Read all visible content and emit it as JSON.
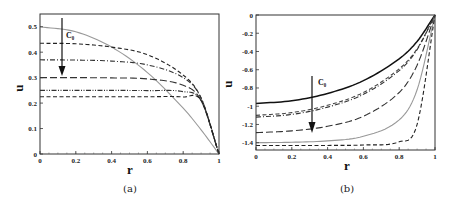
{
  "chart_data": [
    {
      "type": "line",
      "panel": "a",
      "caption": "(a)",
      "xlabel": "r",
      "ylabel": "u",
      "xlim": [
        0,
        1
      ],
      "ylim": [
        0,
        0.55
      ],
      "xticks": [
        "0",
        "0.2",
        "0.4",
        "0.6",
        "0.8",
        "1"
      ],
      "yticks": [
        "0",
        "0.1",
        "0.2",
        "0.3",
        "0.4",
        "0.5"
      ],
      "annotation": "C₀",
      "annotation_arrow": "down, increasing C₀",
      "grid": false,
      "series": [
        {
          "name": "curve-1",
          "style": "solid-gray",
          "color": "#999999",
          "u_at_r0": 0.5,
          "shape": "parabolic",
          "x": [
            0,
            0.2,
            0.4,
            0.6,
            0.8,
            0.9,
            1.0
          ],
          "values": [
            0.5,
            0.48,
            0.42,
            0.32,
            0.18,
            0.095,
            0.0
          ]
        },
        {
          "name": "curve-2",
          "style": "dashed",
          "color": "#222222",
          "u_at_r0": 0.435,
          "x": [
            0,
            0.2,
            0.4,
            0.6,
            0.8,
            0.9,
            1.0
          ],
          "values": [
            0.435,
            0.433,
            0.42,
            0.39,
            0.31,
            0.22,
            0.0
          ]
        },
        {
          "name": "curve-3",
          "style": "dash-dot",
          "color": "#333333",
          "u_at_r0": 0.37,
          "x": [
            0,
            0.2,
            0.4,
            0.6,
            0.8,
            0.9,
            1.0
          ],
          "values": [
            0.37,
            0.369,
            0.365,
            0.35,
            0.3,
            0.22,
            0.0
          ]
        },
        {
          "name": "curve-4",
          "style": "long-dash",
          "color": "#333333",
          "u_at_r0": 0.3,
          "x": [
            0,
            0.2,
            0.4,
            0.6,
            0.8,
            0.9,
            1.0
          ],
          "values": [
            0.3,
            0.3,
            0.299,
            0.295,
            0.27,
            0.21,
            0.0
          ]
        },
        {
          "name": "curve-5",
          "style": "dash-dot-dot",
          "color": "#333333",
          "u_at_r0": 0.25,
          "x": [
            0,
            0.2,
            0.4,
            0.6,
            0.8,
            0.9,
            1.0
          ],
          "values": [
            0.25,
            0.25,
            0.25,
            0.249,
            0.245,
            0.21,
            0.0
          ]
        },
        {
          "name": "curve-6",
          "style": "dashed",
          "color": "#222222",
          "u_at_r0": 0.225,
          "x": [
            0,
            0.2,
            0.4,
            0.6,
            0.8,
            0.9,
            1.0
          ],
          "values": [
            0.225,
            0.225,
            0.225,
            0.225,
            0.224,
            0.21,
            0.0
          ]
        }
      ]
    },
    {
      "type": "line",
      "panel": "b",
      "caption": "(b)",
      "xlabel": "r",
      "ylabel": "u",
      "xlim": [
        0,
        1
      ],
      "ylim": [
        -1.48,
        0
      ],
      "xticks": [
        "0",
        "0.2",
        "0.4",
        "0.6",
        "0.8",
        "1"
      ],
      "yticks": [
        "0",
        "-0.2",
        "-0.4",
        "-0.6",
        "-0.8",
        "-1",
        "-1.2",
        "-1.4"
      ],
      "annotation": "C₀",
      "annotation_arrow": "down, increasing C₀",
      "grid": false,
      "series": [
        {
          "name": "curve-1",
          "style": "solid",
          "color": "#111111",
          "u_at_r0": -0.97,
          "x": [
            0,
            0.2,
            0.4,
            0.6,
            0.8,
            0.9,
            1.0
          ],
          "values": [
            -0.97,
            -0.94,
            -0.86,
            -0.72,
            -0.48,
            -0.29,
            0.0
          ]
        },
        {
          "name": "curve-2",
          "style": "dashed",
          "color": "#444444",
          "u_at_r0": -1.1,
          "x": [
            0,
            0.2,
            0.4,
            0.6,
            0.8,
            0.9,
            1.0
          ],
          "values": [
            -1.1,
            -1.07,
            -0.99,
            -0.85,
            -0.59,
            -0.37,
            0.0
          ]
        },
        {
          "name": "curve-3",
          "style": "dash-dot",
          "color": "#333333",
          "u_at_r0": -1.12,
          "x": [
            0,
            0.2,
            0.4,
            0.6,
            0.8,
            0.9,
            1.0
          ],
          "values": [
            -1.12,
            -1.09,
            -1.01,
            -0.87,
            -0.61,
            -0.38,
            0.0
          ]
        },
        {
          "name": "curve-4",
          "style": "long-dash",
          "color": "#333333",
          "u_at_r0": -1.29,
          "x": [
            0,
            0.2,
            0.4,
            0.6,
            0.8,
            0.9,
            1.0
          ],
          "values": [
            -1.29,
            -1.27,
            -1.22,
            -1.11,
            -0.85,
            -0.55,
            0.0
          ]
        },
        {
          "name": "curve-5",
          "style": "thin-solid-gray",
          "color": "#999999",
          "u_at_r0": -1.4,
          "x": [
            0,
            0.2,
            0.4,
            0.6,
            0.8,
            0.9,
            1.0
          ],
          "values": [
            -1.4,
            -1.395,
            -1.38,
            -1.33,
            -1.15,
            -0.82,
            0.0
          ]
        },
        {
          "name": "curve-6",
          "style": "dashed",
          "color": "#222222",
          "u_at_r0": -1.43,
          "x": [
            0,
            0.2,
            0.4,
            0.6,
            0.8,
            0.9,
            1.0
          ],
          "values": [
            -1.43,
            -1.43,
            -1.43,
            -1.425,
            -1.39,
            -1.2,
            0.0
          ]
        }
      ]
    }
  ],
  "panels": {
    "a": {
      "caption": "(a)",
      "xlabel": "r",
      "ylabel": "u",
      "annotation": "C₀"
    },
    "b": {
      "caption": "(b)",
      "xlabel": "r",
      "ylabel": "u",
      "annotation": "C₀"
    }
  }
}
